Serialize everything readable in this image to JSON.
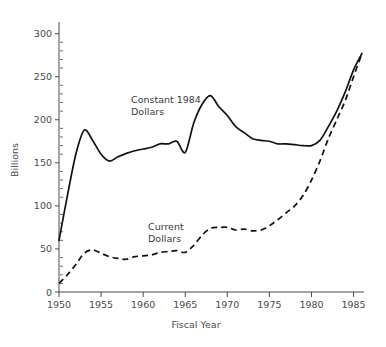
{
  "chart_data": {
    "type": "line",
    "title": "",
    "xlabel": "Fiscal Year",
    "ylabel": "Billions",
    "xlim": [
      1950,
      1986
    ],
    "ylim": [
      0,
      310
    ],
    "xticks": [
      1950,
      1955,
      1960,
      1965,
      1970,
      1975,
      1980,
      1985
    ],
    "xtick_labels": [
      "1950",
      "1955",
      "1960",
      "1965",
      "1970",
      "1975",
      "1980",
      "1985"
    ],
    "yticks": [
      0,
      50,
      100,
      150,
      200,
      250,
      300
    ],
    "ytick_labels": [
      "0",
      "50",
      "100",
      "150",
      "200",
      "250",
      "300"
    ],
    "y_minor_step": 10,
    "grid": false,
    "legend_position": "inline-annotation",
    "x": [
      1950,
      1951,
      1952,
      1953,
      1954,
      1955,
      1956,
      1957,
      1958,
      1959,
      1960,
      1961,
      1962,
      1963,
      1964,
      1965,
      1966,
      1967,
      1968,
      1969,
      1970,
      1971,
      1972,
      1973,
      1974,
      1975,
      1976,
      1977,
      1978,
      1979,
      1980,
      1981,
      1982,
      1983,
      1984,
      1985,
      1986
    ],
    "series": [
      {
        "name": "Constant 1984 Dollars",
        "style": "solid",
        "annotation": "Constant 1984\nDollars",
        "values": [
          60,
          112,
          160,
          188,
          176,
          160,
          152,
          157,
          161,
          164,
          166,
          168,
          172,
          172,
          175,
          162,
          196,
          218,
          228,
          215,
          205,
          192,
          185,
          178,
          176,
          175,
          172,
          172,
          171,
          170,
          170,
          176,
          192,
          210,
          232,
          258,
          277
        ]
      },
      {
        "name": "Current Dollars",
        "style": "dashed",
        "annotation": "Current\nDollars",
        "values": [
          10,
          20,
          32,
          45,
          49,
          45,
          41,
          39,
          38,
          41,
          42,
          43,
          46,
          47,
          48,
          46,
          54,
          66,
          74,
          75,
          75,
          72,
          73,
          71,
          72,
          77,
          84,
          92,
          100,
          112,
          130,
          152,
          178,
          200,
          222,
          250,
          277
        ]
      }
    ]
  },
  "annotations": {
    "constant_label_line1": "Constant 1984",
    "constant_label_line2": "Dollars",
    "current_label_line1": "Current",
    "current_label_line2": "Dollars"
  }
}
